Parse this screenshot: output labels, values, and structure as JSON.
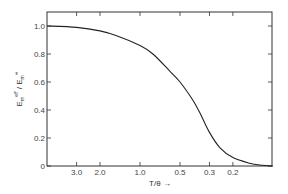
{
  "chart_data": {
    "type": "line",
    "title": "",
    "xlabel": "T/θ →",
    "ylabel": "E_m^eff / E_m^∞",
    "x_scale": "log (reversed)",
    "xlim": [
      5.0,
      0.1
    ],
    "ylim": [
      0,
      1.05
    ],
    "xticks": [
      "3.0",
      "2.0",
      "1.0",
      "0.5",
      "0.3",
      "0.2"
    ],
    "xtick_values": [
      3.0,
      2.0,
      1.0,
      0.5,
      0.3,
      0.2
    ],
    "yticks": [
      "0",
      "0.2",
      "0.4",
      "0.6",
      "0.8",
      "1.0"
    ],
    "ytick_values": [
      0,
      0.2,
      0.4,
      0.6,
      0.8,
      1.0
    ],
    "grid": false,
    "legend": null,
    "series": [
      {
        "name": "E_m^eff / E_m^∞",
        "x": [
          5.0,
          3.0,
          2.0,
          1.5,
          1.0,
          0.8,
          0.6,
          0.5,
          0.4,
          0.35,
          0.3,
          0.25,
          0.2,
          0.15,
          0.12,
          0.1
        ],
        "values": [
          1.0,
          0.99,
          0.965,
          0.93,
          0.86,
          0.8,
          0.68,
          0.6,
          0.47,
          0.37,
          0.24,
          0.13,
          0.06,
          0.02,
          0.005,
          0.0
        ]
      }
    ]
  }
}
